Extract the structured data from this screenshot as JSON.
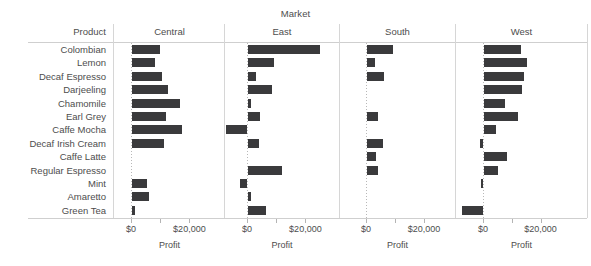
{
  "chart_data": {
    "type": "bar",
    "title": "Market",
    "xlabel": "Profit",
    "ylabel": "Product",
    "orientation": "horizontal",
    "panel_header": "Market",
    "row_header": "Product",
    "grid": false,
    "legend": "none",
    "bar_color": "#3a3a3c",
    "xlim": [
      -10000,
      30000
    ],
    "xticks": [
      0,
      10000,
      20000
    ],
    "xticklabels": [
      "$0",
      "",
      "$20,000"
    ],
    "categories": [
      "Colombian",
      "Lemon",
      "Decaf Espresso",
      "Darjeeling",
      "Chamomile",
      "Earl Grey",
      "Caffe Mocha",
      "Decaf Irish Cream",
      "Caffe Latte",
      "Regular Espresso",
      "Mint",
      "Amaretto",
      "Green Tea"
    ],
    "panels": [
      "Central",
      "East",
      "South",
      "West"
    ],
    "series": [
      {
        "name": "Central",
        "values": [
          9500,
          7800,
          10200,
          12200,
          16600,
          11500,
          17000,
          10800,
          0,
          0,
          5100,
          5800,
          1000
        ]
      },
      {
        "name": "East",
        "values": [
          24800,
          8800,
          2700,
          8100,
          1000,
          4100,
          -7100,
          3700,
          0,
          11500,
          -2400,
          1000,
          6100
        ]
      },
      {
        "name": "South",
        "values": [
          9100,
          2700,
          5800,
          0,
          0,
          3700,
          0,
          5400,
          3000,
          3700,
          0,
          0,
          0
        ]
      },
      {
        "name": "West",
        "values": [
          12900,
          15100,
          14000,
          13300,
          7400,
          11900,
          4200,
          -1000,
          8100,
          4900,
          -700,
          0,
          -7400
        ]
      }
    ]
  },
  "axes": [
    {
      "panel": "Central",
      "label": "Profit",
      "ticks": [
        "$0",
        "",
        "$20,000"
      ]
    },
    {
      "panel": "East",
      "label": "Profit",
      "ticks": [
        "$0",
        "",
        "$20,000"
      ]
    },
    {
      "panel": "South",
      "label": "Profit",
      "ticks": [
        "$0",
        "",
        "$20,000"
      ]
    },
    {
      "panel": "West",
      "label": "Profit",
      "ticks": [
        "$0",
        "",
        "$20,000"
      ]
    }
  ]
}
